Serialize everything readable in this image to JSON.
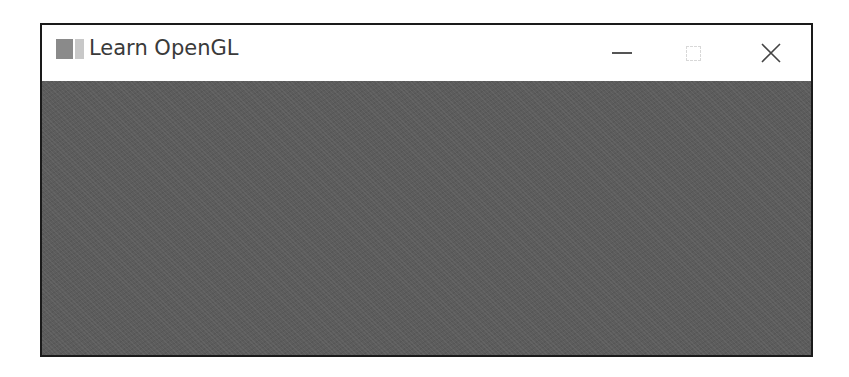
{
  "window": {
    "title": "Learn OpenGL",
    "icon": "app-icon",
    "controls": {
      "minimize": "minimize-icon",
      "maximize": "maximize-icon",
      "close": "close-icon"
    },
    "client_color": "#5c5c5c"
  }
}
